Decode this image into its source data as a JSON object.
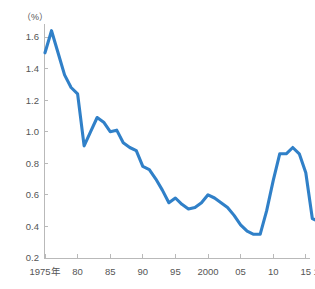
{
  "chart_data": {
    "type": "line",
    "title": "",
    "subtitle": "",
    "xlabel": "",
    "ylabel": "",
    "unit_label": "（%）",
    "grid": false,
    "legend": "none",
    "line_color": "#3080c8",
    "axis_color": "#b9b9b9",
    "tick_label_color": "#555555",
    "xlim": [
      1974.2,
      2017.6
    ],
    "ylim": [
      0.2,
      1.68
    ],
    "ytick_values": [
      0.2,
      0.4,
      0.6,
      0.8,
      1.0,
      1.2,
      1.4,
      1.6
    ],
    "ytick_labels": [
      "0.2",
      "0.4",
      "0.6",
      "0.8",
      "1.0",
      "1.2",
      "1.4",
      "1.6"
    ],
    "xtick_values": [
      1975,
      1980,
      1985,
      1990,
      1995,
      2000,
      2005,
      2010,
      2015,
      2017
    ],
    "xtick_labels": [
      "1975年",
      "80",
      "85",
      "90",
      "95",
      "2000",
      "05",
      "10",
      "15",
      "17"
    ],
    "x": [
      1975,
      1976,
      1977,
      1978,
      1979,
      1980,
      1981,
      1982,
      1983,
      1984,
      1985,
      1986,
      1987,
      1988,
      1989,
      1990,
      1991,
      1992,
      1993,
      1994,
      1995,
      1996,
      1997,
      1998,
      1999,
      2000,
      2001,
      2002,
      2003,
      2004,
      2005,
      2006,
      2007,
      2008,
      2009,
      2010,
      2011,
      2012,
      2013,
      2014,
      2015,
      2016,
      2017
    ],
    "values": [
      1.5,
      1.64,
      1.5,
      1.36,
      1.28,
      1.24,
      0.91,
      1.0,
      1.09,
      1.06,
      1.0,
      1.01,
      0.93,
      0.9,
      0.88,
      0.78,
      0.76,
      0.7,
      0.63,
      0.55,
      0.58,
      0.54,
      0.51,
      0.52,
      0.55,
      0.6,
      0.58,
      0.55,
      0.52,
      0.47,
      0.41,
      0.37,
      0.35,
      0.35,
      0.5,
      0.69,
      0.86,
      0.86,
      0.9,
      0.86,
      0.74,
      0.45,
      0.43
    ],
    "series_name": ""
  }
}
